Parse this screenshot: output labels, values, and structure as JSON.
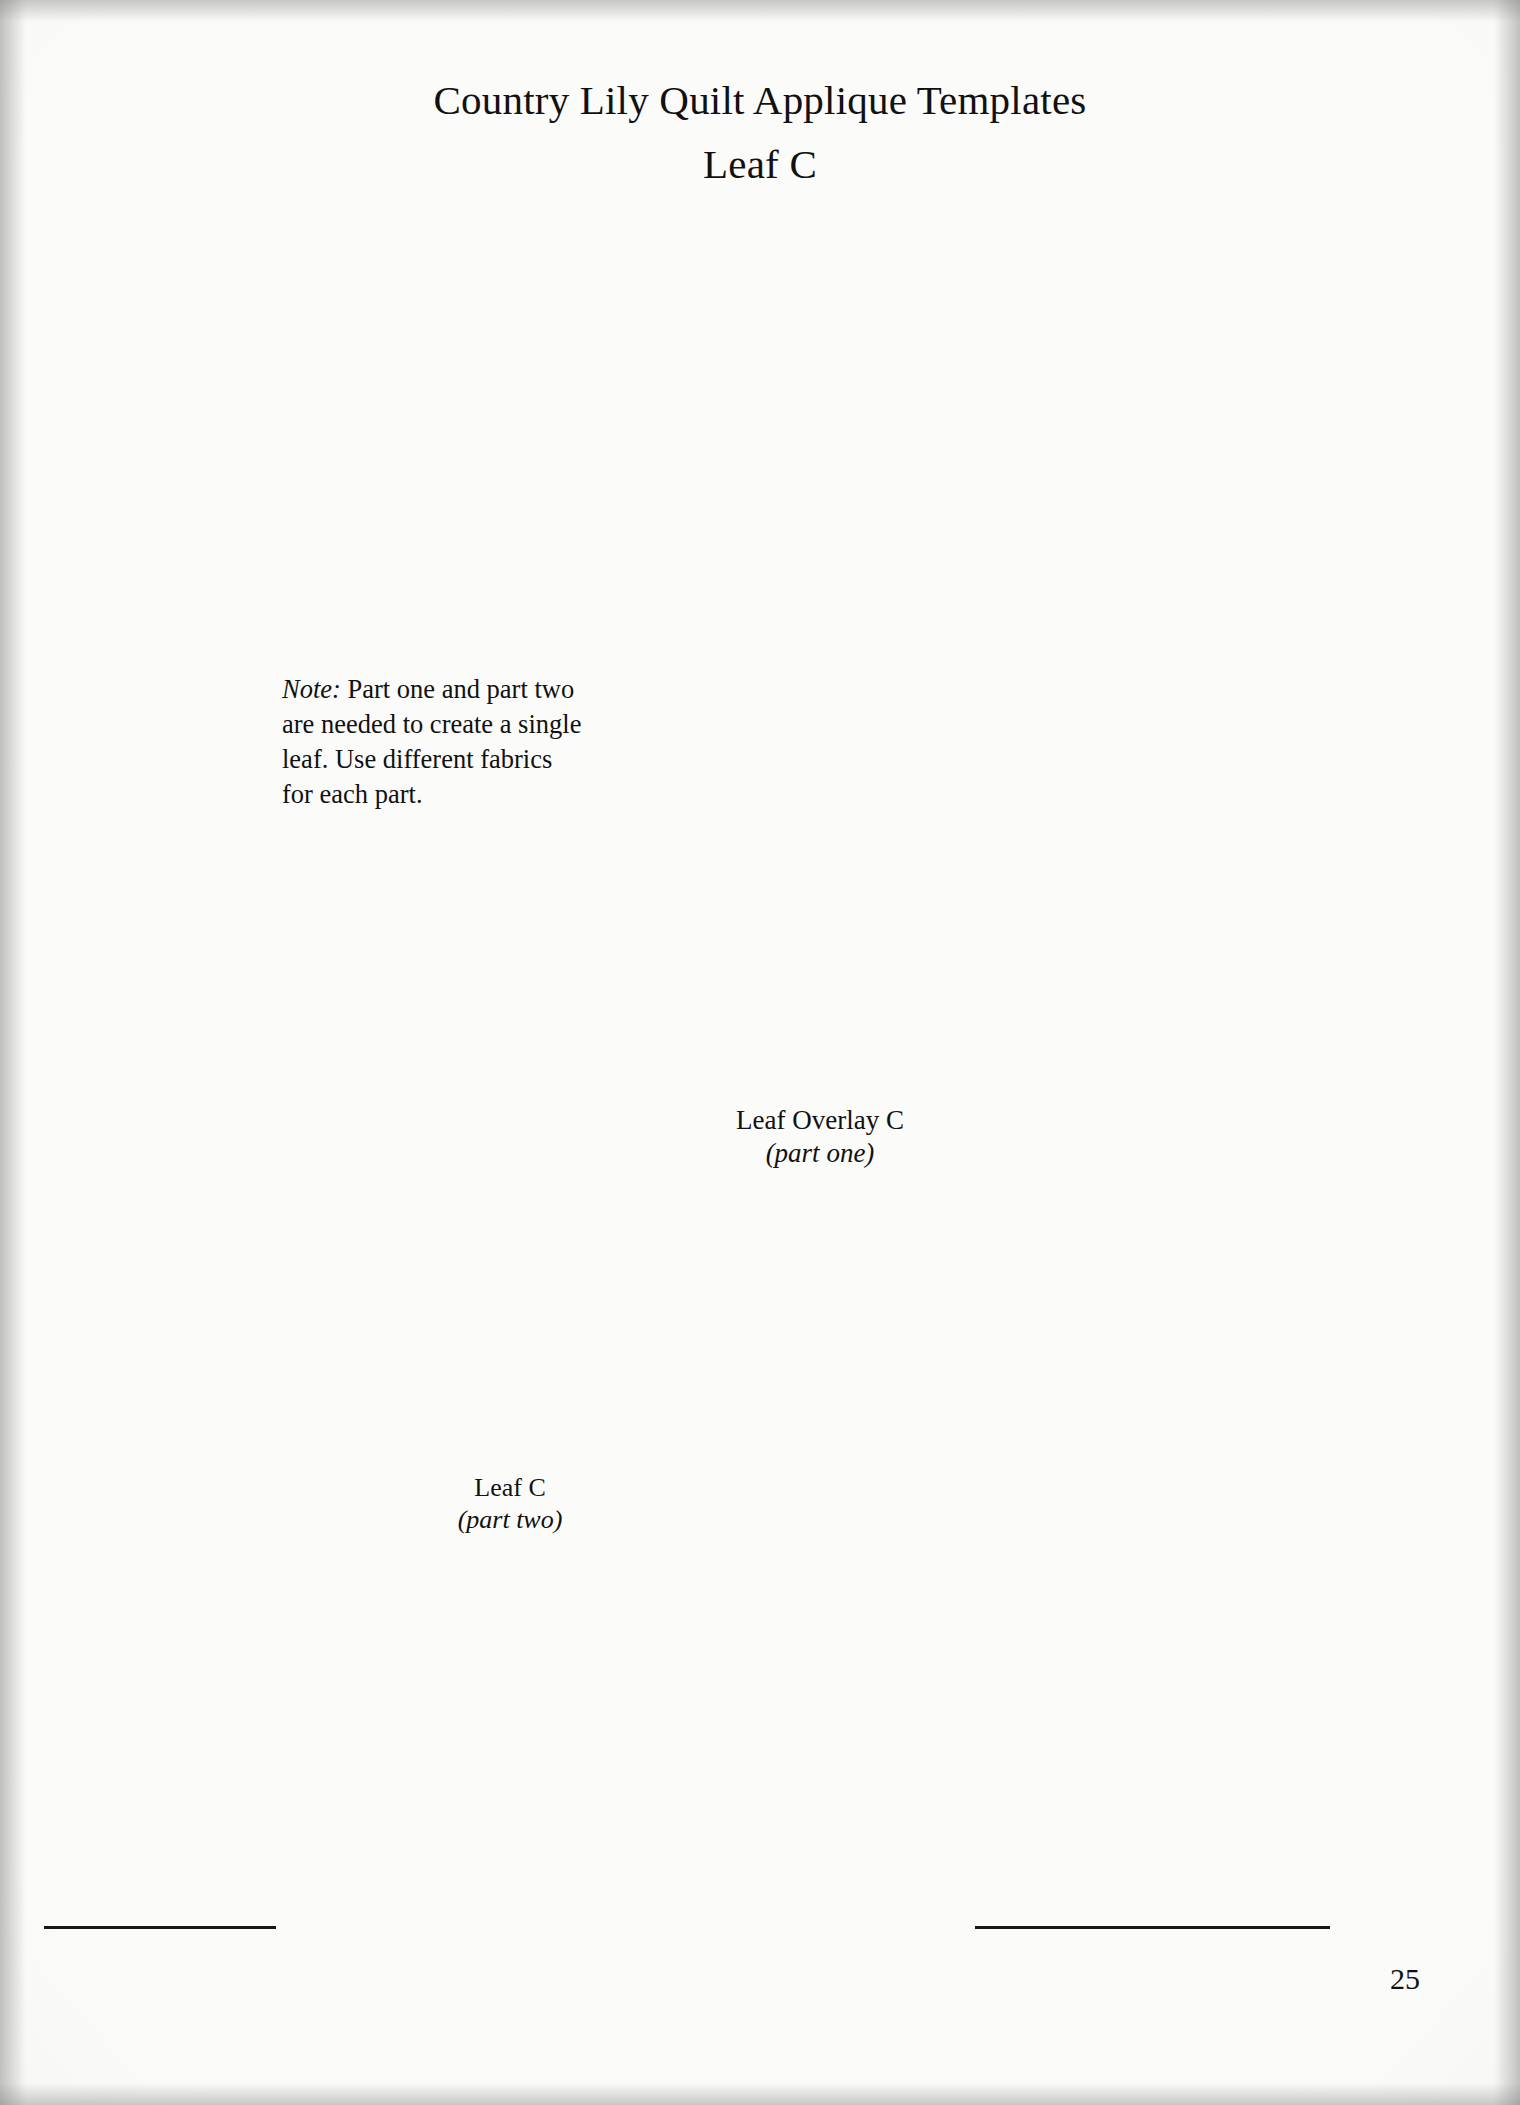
{
  "page": {
    "number": "25",
    "background_color": "#fbfbf9",
    "ink_color": "#111111"
  },
  "title": {
    "line1": "Country Lily Quilt Applique Templates",
    "line2": "Leaf C"
  },
  "note": {
    "lead": "Note:",
    "body": " Part one and part two are needed to create a single leaf. Use different fabrics for each part."
  },
  "labels": {
    "overlay": {
      "name": "Leaf Overlay C",
      "part": "(part one)"
    },
    "leaf": {
      "name": "Leaf C",
      "part": "(part two)"
    }
  },
  "template": {
    "seam_fill_color": "#c4c4c4",
    "outline_color": "#111111",
    "dashed_edge": "cutting line",
    "solid_edge": "stitching line"
  }
}
